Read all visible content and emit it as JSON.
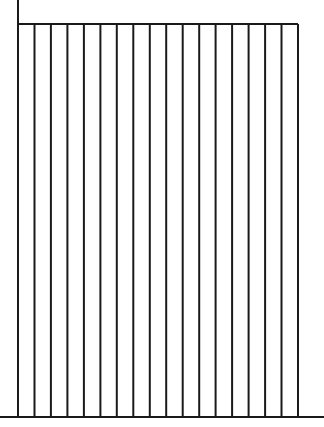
{
  "diagram": {
    "type": "striped-rectangle-line-drawing",
    "stroke_color": "#1a1a1a",
    "background_color": "#ffffff",
    "left_axis": {
      "x": 18,
      "y_top": 0,
      "y_bottom": 417
    },
    "top_edge": {
      "y": 24,
      "x_start": 18,
      "x_end": 298
    },
    "baseline": {
      "y": 417,
      "x_start": 0,
      "x_end": 324
    },
    "vertical_lines": {
      "count": 18,
      "x_start": 18,
      "x_end": 298,
      "y_top": 24,
      "y_bottom": 417
    },
    "stripe_count": 17
  }
}
